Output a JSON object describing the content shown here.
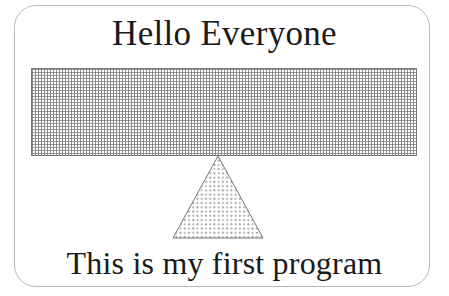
{
  "figure": {
    "title": "Hello Everyone",
    "caption": "This is my first program",
    "shapes": {
      "beam": {
        "name": "seesaw-beam",
        "kind": "rectangle",
        "fill_pattern": "fine-dot-grid-stipple",
        "outline_color": "#777777",
        "fill_color": "#8a8a8a"
      },
      "fulcrum": {
        "name": "fulcrum-triangle",
        "kind": "triangle",
        "fill_pattern": "diagonal-dot-hatch",
        "outline_color": "#777777",
        "fill_color": "#8a8a8a"
      },
      "frame": {
        "name": "slide-frame",
        "kind": "rounded-rectangle",
        "outline_color": "#b9b9b9",
        "background_color": "#ffffff"
      }
    },
    "text_color": "#1a1a1a",
    "page_background": "#ffffff"
  }
}
